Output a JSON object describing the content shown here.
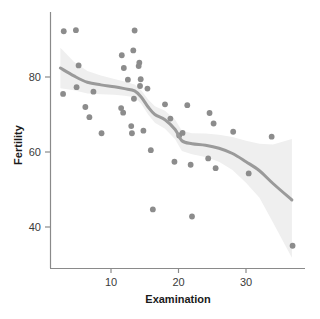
{
  "chart_data": {
    "type": "scatter",
    "title": "",
    "xlabel": "Examination",
    "ylabel": "Fertility",
    "xlim": [
      1.5,
      38
    ],
    "ylim": [
      32,
      95
    ],
    "xticks": [
      10,
      20,
      30
    ],
    "xticklabels": [
      "10",
      "20",
      "30"
    ],
    "yticks": [
      40,
      60,
      80
    ],
    "yticklabels": [
      "40",
      "60",
      "80"
    ],
    "grid": false,
    "legend": null,
    "point_color": "#8c8c8c",
    "line_color": "#9a9a9a",
    "ribbon_color": "#efefef",
    "axis_color": "#8a8a8a",
    "background": "#ffffff",
    "x": [
      3,
      5,
      3,
      15,
      7,
      16,
      14,
      12,
      12,
      16,
      17,
      15,
      16,
      14,
      21,
      16,
      14,
      19,
      22,
      22,
      20,
      9,
      5,
      6,
      26,
      31,
      19,
      22,
      7,
      25,
      3,
      26,
      29,
      22,
      35,
      15,
      19,
      10,
      22,
      14,
      13,
      11,
      13,
      32,
      7,
      53,
      29
    ],
    "y": [
      80.2,
      83.1,
      92.5,
      85.8,
      76.9,
      76.1,
      83.8,
      92.4,
      82.4,
      82.9,
      87.1,
      64.1,
      66.9,
      68.9,
      61.7,
      68.3,
      71.7,
      55.7,
      54.3,
      65.1,
      65.5,
      65.0,
      56.6,
      57.4,
      72.5,
      74.2,
      72.0,
      60.5,
      58.3,
      65.4,
      75.5,
      69.3,
      77.3,
      70.5,
      79.4,
      65.0,
      92.2,
      79.3,
      70.4,
      65.7,
      72.7,
      64.4,
      77.6,
      67.6,
      35.0,
      44.7,
      42.8
    ],
    "points": [
      {
        "x": 3.0,
        "y": 92.2
      },
      {
        "x": 4.8,
        "y": 92.5
      },
      {
        "x": 2.9,
        "y": 75.5
      },
      {
        "x": 5.2,
        "y": 83.1
      },
      {
        "x": 4.9,
        "y": 77.3
      },
      {
        "x": 6.2,
        "y": 72.0
      },
      {
        "x": 6.8,
        "y": 69.3
      },
      {
        "x": 7.4,
        "y": 76.1
      },
      {
        "x": 8.6,
        "y": 65.0
      },
      {
        "x": 11.6,
        "y": 85.8
      },
      {
        "x": 11.9,
        "y": 82.4
      },
      {
        "x": 11.5,
        "y": 71.7
      },
      {
        "x": 11.8,
        "y": 70.5
      },
      {
        "x": 12.5,
        "y": 79.3
      },
      {
        "x": 13.5,
        "y": 92.4
      },
      {
        "x": 13.3,
        "y": 87.1
      },
      {
        "x": 13.4,
        "y": 74.2
      },
      {
        "x": 13.0,
        "y": 66.9
      },
      {
        "x": 13.1,
        "y": 65.0
      },
      {
        "x": 14.2,
        "y": 83.8
      },
      {
        "x": 14.1,
        "y": 82.9
      },
      {
        "x": 14.4,
        "y": 79.4
      },
      {
        "x": 14.3,
        "y": 77.6
      },
      {
        "x": 14.8,
        "y": 65.7
      },
      {
        "x": 15.4,
        "y": 76.9
      },
      {
        "x": 15.9,
        "y": 60.5
      },
      {
        "x": 16.2,
        "y": 44.7
      },
      {
        "x": 18.0,
        "y": 72.7
      },
      {
        "x": 18.8,
        "y": 68.9
      },
      {
        "x": 19.4,
        "y": 57.4
      },
      {
        "x": 20.1,
        "y": 64.4
      },
      {
        "x": 20.6,
        "y": 65.1
      },
      {
        "x": 21.3,
        "y": 72.5
      },
      {
        "x": 21.8,
        "y": 56.6
      },
      {
        "x": 22.0,
        "y": 42.8
      },
      {
        "x": 24.4,
        "y": 58.3
      },
      {
        "x": 24.6,
        "y": 70.4
      },
      {
        "x": 25.5,
        "y": 55.7
      },
      {
        "x": 25.2,
        "y": 67.6
      },
      {
        "x": 28.1,
        "y": 65.4
      },
      {
        "x": 30.4,
        "y": 54.3
      },
      {
        "x": 33.8,
        "y": 64.1
      },
      {
        "x": 36.9,
        "y": 35.0
      }
    ],
    "smoother": {
      "method": "loess",
      "x": [
        2.5,
        4.5,
        6.5,
        8.5,
        10.5,
        12.0,
        13.5,
        14.5,
        15.5,
        16.5,
        18.0,
        19.5,
        20.5,
        22.0,
        24.0,
        26.0,
        28.0,
        30.0,
        32.0,
        34.0,
        36.8
      ],
      "fit": [
        82.4,
        80.3,
        78.6,
        77.9,
        77.4,
        76.9,
        76.3,
        74.6,
        72.0,
        70.0,
        68.6,
        66.0,
        63.0,
        62.2,
        61.8,
        61.0,
        59.6,
        57.4,
        55.0,
        51.6,
        47.2
      ],
      "upper": [
        87.8,
        84.1,
        81.6,
        80.4,
        79.5,
        78.8,
        78.0,
        76.4,
        74.0,
        72.2,
        71.0,
        68.6,
        65.7,
        65.0,
        64.9,
        64.6,
        64.0,
        63.0,
        62.2,
        62.0,
        63.5
      ],
      "lower": [
        77.0,
        76.5,
        75.6,
        75.4,
        75.3,
        75.0,
        74.6,
        72.8,
        70.0,
        67.8,
        66.2,
        63.4,
        60.3,
        59.4,
        58.7,
        57.4,
        55.2,
        51.8,
        47.8,
        41.2,
        31.8
      ]
    }
  },
  "axes": {
    "x_title": "Examination",
    "y_title": "Fertility"
  }
}
